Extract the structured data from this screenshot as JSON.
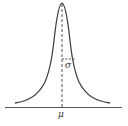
{
  "diagram": {
    "type": "bell-curve",
    "labels": {
      "mean": "μ",
      "sigma": "σ"
    },
    "colors": {
      "curve": "#444444",
      "axis": "#555555",
      "dashed": "#555555",
      "text": "#333333",
      "background": "#ffffff"
    }
  }
}
